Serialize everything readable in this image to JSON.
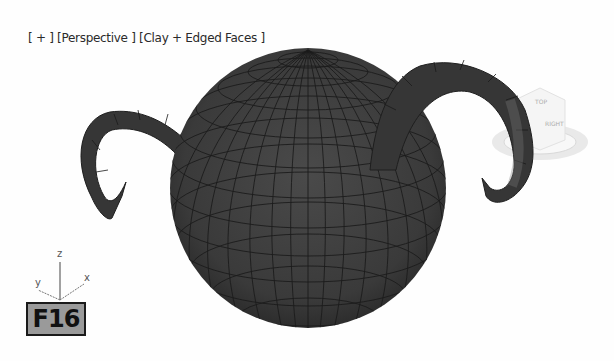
{
  "viewport": {
    "label_plus": "[ + ]",
    "label_view": "[Perspective ]",
    "label_shading": "[Clay + Edged Faces ]"
  },
  "axis_tripod": {
    "z": "z",
    "y": "y",
    "x": "x"
  },
  "badge": {
    "text": "F16"
  },
  "viewcube": {
    "top_label": "TOP",
    "side_label": "RIGHT"
  },
  "colors": {
    "mesh_fill": "#3c3c3c",
    "mesh_edge": "#1a1a1a",
    "background": "#fefefe",
    "badge_bg": "#9a9a9a"
  }
}
